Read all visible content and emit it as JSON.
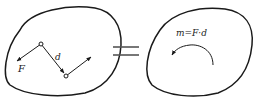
{
  "diagram": {
    "type": "force-couple-equivalence",
    "left_panel": {
      "force_label": "F",
      "distance_label": "d"
    },
    "equals_symbol": "=",
    "right_panel": {
      "moment_label": "m=F·d",
      "moment_direction": "counterclockwise"
    },
    "colors": {
      "stroke": "#1a1a1a",
      "background": "#ffffff"
    }
  }
}
